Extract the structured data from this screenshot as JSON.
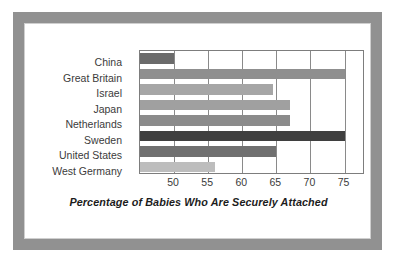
{
  "chart_data": {
    "type": "bar",
    "orientation": "horizontal",
    "title": "",
    "xlabel": "Percentage of Babies Who Are Securely Attached",
    "ylabel": "",
    "categories": [
      "China",
      "Great Britain",
      "Israel",
      "Japan",
      "Netherlands",
      "Sweden",
      "United States",
      "West Germany"
    ],
    "values": [
      50,
      75,
      64.5,
      67,
      67,
      75,
      65,
      56
    ],
    "bar_colors": [
      "#6b6b6b",
      "#8f8f8f",
      "#a6a6a6",
      "#a0a0a0",
      "#8b8b8b",
      "#3f3f3f",
      "#707070",
      "#bdbdbd"
    ],
    "xlim": [
      45,
      78
    ],
    "xticks": [
      50,
      55,
      60,
      65,
      70,
      75
    ],
    "xtick_labels": [
      "50",
      "55",
      "60",
      "65",
      "70",
      "75"
    ],
    "grid": true,
    "grid_axis": "x",
    "legend": false
  },
  "style": {
    "frame_color": "#919191",
    "plot_border_color": "#7d7d7d",
    "gridline_color": "#8a8a8a",
    "label_color": "#3b3b3b",
    "background": "#ffffff"
  }
}
